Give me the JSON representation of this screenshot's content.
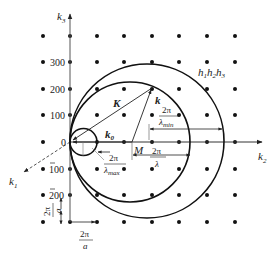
{
  "diagram": {
    "type": "ewald-sphere-reciprocal-lattice",
    "axes": {
      "k3": {
        "label": "k",
        "sub": "3"
      },
      "k2": {
        "label": "k",
        "sub": "2"
      },
      "k1": {
        "label": "k",
        "sub": "1"
      }
    },
    "origin_label": "0",
    "k3_ticks": [
      {
        "label": "300",
        "overbar": false
      },
      {
        "label": "200",
        "overbar": false
      },
      {
        "label": "100",
        "overbar": false
      },
      {
        "label": "100",
        "overbar": true
      },
      {
        "label": "200",
        "overbar": true
      }
    ],
    "vectors": {
      "K": "K",
      "k": "k",
      "k0": {
        "label": "k",
        "sub": "0"
      }
    },
    "center_label": "M",
    "plane_label": {
      "h1": "h",
      "s1": "1",
      "h2": "h",
      "s2": "2",
      "h3": "h",
      "s3": "3"
    },
    "dimensions": {
      "lambda_min": {
        "num": "2π",
        "den": "λ",
        "sub": "min"
      },
      "lambda": {
        "num": "2π",
        "den": "λ"
      },
      "lambda_max": {
        "num": "2π",
        "den": "λ",
        "sub": "max"
      },
      "lattice_vertical": {
        "num": "2π",
        "den": "a"
      },
      "lattice_horizontal": {
        "num": "2π",
        "den": "a"
      }
    },
    "colors": {
      "ink": "#222222",
      "axis": "#555555",
      "background": "#ffffff"
    }
  }
}
